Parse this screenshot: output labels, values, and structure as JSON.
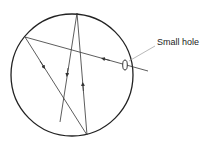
{
  "diagram": {
    "label": "Small hole",
    "colors": {
      "outline": "#222222",
      "ray": "#333333",
      "leader": "#999999",
      "background": "#ffffff"
    }
  }
}
